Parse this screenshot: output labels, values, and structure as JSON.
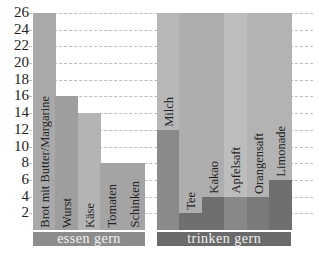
{
  "chart_data": {
    "type": "bar",
    "title": "",
    "xlabel": "",
    "ylabel": "",
    "ylim": [
      0,
      26
    ],
    "yticks": [
      2,
      4,
      6,
      8,
      10,
      12,
      14,
      16,
      18,
      20,
      22,
      24,
      26
    ],
    "grid": true,
    "groups": [
      {
        "name": "essen gern",
        "categories": [
          "Brot mit Butter/Margarine",
          "Wurst",
          "Käse",
          "Tomaten",
          "Schinken"
        ],
        "values": [
          26,
          16,
          14,
          8,
          8
        ]
      },
      {
        "name": "trinken gern",
        "categories": [
          "Milch",
          "Tee",
          "Kakao",
          "Apfelsaft",
          "Orangensaft",
          "Limonade"
        ],
        "values": [
          12,
          2,
          4,
          4,
          4,
          6
        ]
      }
    ],
    "colors": {
      "food_bars": [
        "#a9a9a9",
        "#9e9e9e",
        "#b4b4b4",
        "#a4a4a4",
        "#a4a4a4"
      ],
      "drink_background": [
        "#b7b7b7",
        "#aeaeae",
        "#aeaeae",
        "#bdbdbd",
        "#b3b3b3",
        "#b3b3b3"
      ],
      "drink_bars": [
        "#8a8a8a",
        "#6f6f6f",
        "#6f6f6f",
        "#888888",
        "#7a7a7a",
        "#6f6f6f"
      ],
      "group_label_bg": [
        "#8c8c8c",
        "#6a6a6a"
      ]
    }
  }
}
